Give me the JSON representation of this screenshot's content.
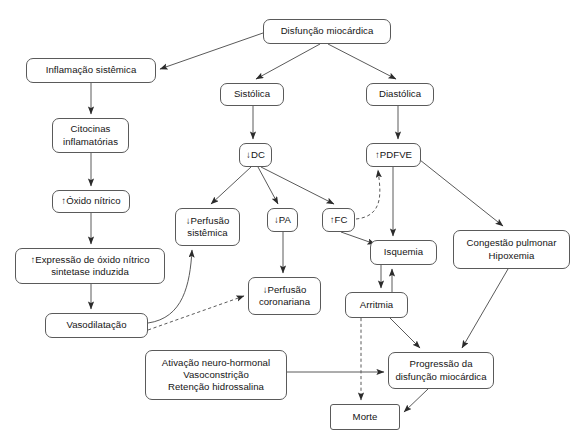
{
  "diagram": {
    "type": "flowchart",
    "background": "#ffffff",
    "stroke_color": "#5a5a5a",
    "text_color": "#141414",
    "nodes": [
      {
        "id": "disfuncao",
        "label": "Disfunção miocárdica",
        "x": 263,
        "y": 19,
        "w": 128,
        "h": 25,
        "shape": "rounded"
      },
      {
        "id": "inflamacao",
        "label": "Inflamação sistêmica",
        "x": 26,
        "y": 58,
        "w": 130,
        "h": 25,
        "shape": "rounded"
      },
      {
        "id": "sistolica",
        "label": "Sistólica",
        "x": 220,
        "y": 83,
        "w": 64,
        "h": 23,
        "shape": "rounded"
      },
      {
        "id": "diastolica",
        "label": "Diastólica",
        "x": 366,
        "y": 83,
        "w": 68,
        "h": 23,
        "shape": "rounded"
      },
      {
        "id": "citocinas",
        "label": "Citocinas\ninflamatórias",
        "x": 52,
        "y": 118,
        "w": 77,
        "h": 35,
        "shape": "rounded"
      },
      {
        "id": "dc",
        "label": "↓DC",
        "x": 239,
        "y": 143,
        "w": 33,
        "h": 24,
        "shape": "rounded"
      },
      {
        "id": "pdfve",
        "label": "↑PDFVE",
        "x": 366,
        "y": 143,
        "w": 55,
        "h": 24,
        "shape": "rounded"
      },
      {
        "id": "oxido",
        "label": "↑Óxido nítrico",
        "x": 52,
        "y": 190,
        "w": 78,
        "h": 23,
        "shape": "rounded"
      },
      {
        "id": "perf_sist",
        "label": "↓Perfusão\nsistêmica",
        "x": 175,
        "y": 208,
        "w": 65,
        "h": 38,
        "shape": "rounded"
      },
      {
        "id": "pa",
        "label": "↓PA",
        "x": 267,
        "y": 208,
        "w": 31,
        "h": 24,
        "shape": "rounded"
      },
      {
        "id": "fc",
        "label": "↑FC",
        "x": 322,
        "y": 208,
        "w": 33,
        "h": 24,
        "shape": "rounded"
      },
      {
        "id": "congestao",
        "label": "Congestão pulmonar\nHipoxemia",
        "x": 453,
        "y": 230,
        "w": 117,
        "h": 39,
        "shape": "rounded"
      },
      {
        "id": "isquemia",
        "label": "Isquemia",
        "x": 370,
        "y": 240,
        "w": 67,
        "h": 25,
        "shape": "rounded"
      },
      {
        "id": "expressao",
        "label": "↑Expressão de óxido nítrico\nsintetase induzida",
        "x": 15,
        "y": 248,
        "w": 150,
        "h": 36,
        "shape": "rounded"
      },
      {
        "id": "perf_coron",
        "label": "↓Perfusão\ncoronariana",
        "x": 248,
        "y": 277,
        "w": 73,
        "h": 38,
        "shape": "rounded"
      },
      {
        "id": "arritmia",
        "label": "Arritmia",
        "x": 345,
        "y": 292,
        "w": 63,
        "h": 26,
        "shape": "rounded"
      },
      {
        "id": "vasodilatacao",
        "label": "Vasodilatação",
        "x": 45,
        "y": 313,
        "w": 103,
        "h": 25,
        "shape": "rounded"
      },
      {
        "id": "ativacao",
        "label": "Ativação neuro-hormonal\nVasoconstrição\nRetenção hidrossalina",
        "x": 145,
        "y": 350,
        "w": 142,
        "h": 50,
        "shape": "rounded"
      },
      {
        "id": "progressao",
        "label": "Progressão da\ndisfunção miocárdica",
        "x": 388,
        "y": 352,
        "w": 106,
        "h": 37,
        "shape": "rounded"
      },
      {
        "id": "morte",
        "label": "Morte",
        "x": 330,
        "y": 404,
        "w": 70,
        "h": 26,
        "shape": "square"
      }
    ],
    "edges": [
      {
        "id": "e-disfuncao-inflamacao",
        "from": "disfuncao",
        "to": "inflamacao",
        "style": "solid",
        "path": "M 263,33 L 160,69",
        "arrow": "end"
      },
      {
        "id": "e-disfuncao-sistolica",
        "from": "disfuncao",
        "to": "sistolica",
        "style": "solid",
        "path": "M 320,44 L 256,79",
        "arrow": "end"
      },
      {
        "id": "e-disfuncao-diastolica",
        "from": "disfuncao",
        "to": "diastolica",
        "style": "solid",
        "path": "M 328,44 L 396,79",
        "arrow": "end"
      },
      {
        "id": "e-inflamacao-citocinas",
        "from": "inflamacao",
        "to": "citocinas",
        "style": "solid",
        "path": "M 91,83 L 91,114",
        "arrow": "end"
      },
      {
        "id": "e-sistolica-dc",
        "from": "sistolica",
        "to": "dc",
        "style": "solid",
        "path": "M 253,106 L 253,139",
        "arrow": "end"
      },
      {
        "id": "e-diastolica-pdfve",
        "from": "diastolica",
        "to": "pdfve",
        "style": "solid",
        "path": "M 398,106 L 398,139",
        "arrow": "end"
      },
      {
        "id": "e-citocinas-oxido",
        "from": "citocinas",
        "to": "oxido",
        "style": "solid",
        "path": "M 91,153 L 91,186",
        "arrow": "end"
      },
      {
        "id": "e-dc-perfsist",
        "from": "dc",
        "to": "perf_sist",
        "style": "solid",
        "path": "M 251,167 L 211,204",
        "arrow": "end"
      },
      {
        "id": "e-dc-pa",
        "from": "dc",
        "to": "pa",
        "style": "solid",
        "path": "M 258,167 L 278,204",
        "arrow": "end"
      },
      {
        "id": "e-dc-fc",
        "from": "dc",
        "to": "fc",
        "style": "solid",
        "path": "M 261,167 L 334,204",
        "arrow": "end"
      },
      {
        "id": "e-pdfve-isquemia",
        "from": "pdfve",
        "to": "isquemia",
        "style": "solid",
        "path": "M 393,167 L 393,236",
        "arrow": "end"
      },
      {
        "id": "e-pdfve-congestao",
        "from": "pdfve",
        "to": "congestao",
        "style": "solid",
        "path": "M 420,160 L 503,226",
        "arrow": "end"
      },
      {
        "id": "e-fc-pdfve",
        "from": "fc",
        "to": "pdfve",
        "style": "dashed",
        "path": "M 356,219 C 386,216 380,188 378,170",
        "arrow": "end"
      },
      {
        "id": "e-fc-isquemia",
        "from": "fc",
        "to": "isquemia",
        "style": "solid",
        "path": "M 341,232 L 375,244",
        "arrow": "end"
      },
      {
        "id": "e-oxido-expressao",
        "from": "oxido",
        "to": "expressao",
        "style": "solid",
        "path": "M 91,213 L 91,244",
        "arrow": "end"
      },
      {
        "id": "e-pa-perfcoron",
        "from": "pa",
        "to": "perf_coron",
        "style": "solid",
        "path": "M 283,232 L 283,273",
        "arrow": "end"
      },
      {
        "id": "e-isquemia-arritmia",
        "from": "isquemia",
        "to": "arritmia",
        "style": "solid",
        "path": "M 381,265 L 381,288",
        "arrow": "end"
      },
      {
        "id": "e-arritmia-isquemia",
        "from": "arritmia",
        "to": "isquemia",
        "style": "solid",
        "path": "M 392,292 L 392,269",
        "arrow": "end"
      },
      {
        "id": "e-expressao-vasodil",
        "from": "expressao",
        "to": "vasodilatacao",
        "style": "solid",
        "path": "M 91,284 L 91,309",
        "arrow": "end"
      },
      {
        "id": "e-vasodil-perfsist",
        "from": "vasodilatacao",
        "to": "perf_sist",
        "style": "solid",
        "path": "M 148,323 C 183,318 190,285 192,250",
        "arrow": "end"
      },
      {
        "id": "e-vasodil-perfcoron",
        "from": "vasodilatacao",
        "to": "perf_coron",
        "style": "dashed",
        "path": "M 148,330 L 244,296",
        "arrow": "end"
      },
      {
        "id": "e-congestao-progress",
        "from": "congestao",
        "to": "progressao",
        "style": "solid",
        "path": "M 508,269 L 462,348",
        "arrow": "end"
      },
      {
        "id": "e-arritmia-progress",
        "from": "arritmia",
        "to": "progressao",
        "style": "solid",
        "path": "M 390,318 L 420,348",
        "arrow": "end"
      },
      {
        "id": "e-arritmia-morte",
        "from": "arritmia",
        "to": "morte",
        "style": "dashed",
        "path": "M 361,318 L 361,400",
        "arrow": "end"
      },
      {
        "id": "e-ativacao-progress",
        "from": "ativacao",
        "to": "progressao",
        "style": "solid",
        "path": "M 287,372 L 384,372",
        "arrow": "end"
      },
      {
        "id": "e-progress-morte",
        "from": "progressao",
        "to": "morte",
        "style": "solid",
        "path": "M 428,389 L 404,412",
        "arrow": "end"
      }
    ]
  }
}
